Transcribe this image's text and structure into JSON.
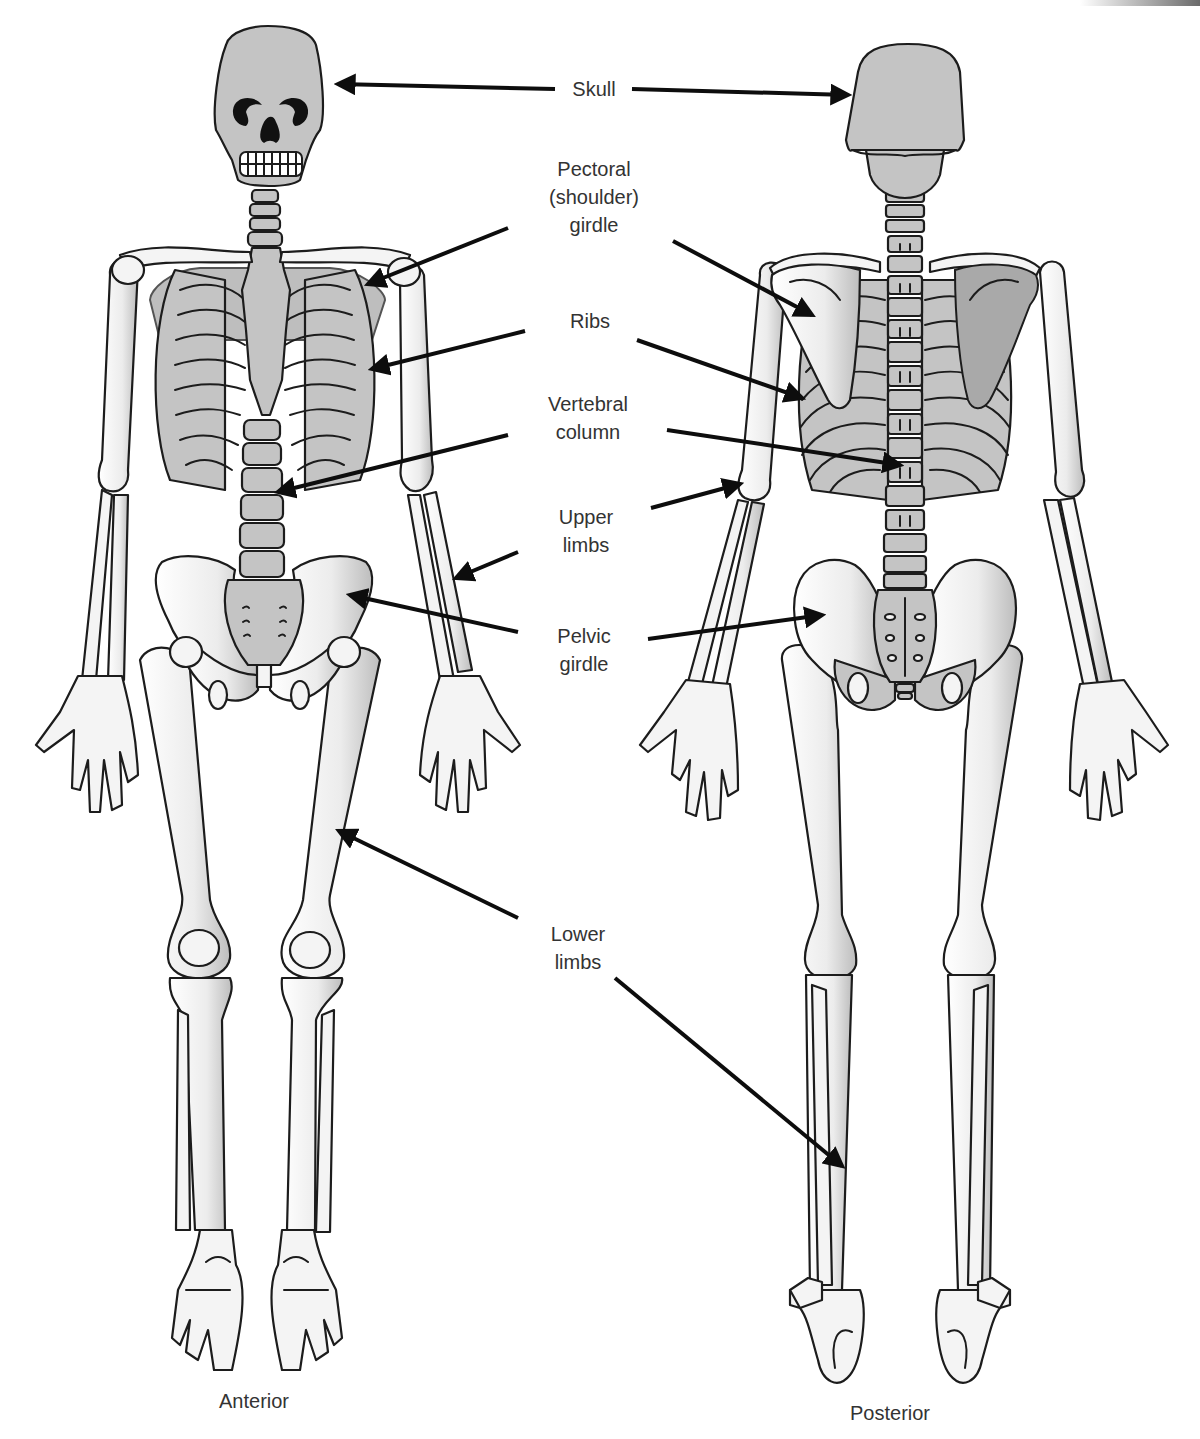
{
  "figure": {
    "views": [
      {
        "id": "anterior",
        "caption": "Anterior",
        "caption_x": 254,
        "caption_y": 1390
      },
      {
        "id": "posterior",
        "caption": "Posterior",
        "caption_x": 890,
        "caption_y": 1402
      }
    ],
    "colors": {
      "bone_light": "#f4f4f4",
      "bone_grey": "#c4c4c4",
      "bone_dark": "#a9a9a9",
      "outline": "#1c1c1c",
      "arrow": "#0d0d0d",
      "label_text": "#333333",
      "background": "#ffffff"
    },
    "labels": [
      {
        "id": "skull",
        "lines": [
          "Skull"
        ],
        "x": 594,
        "y": 75
      },
      {
        "id": "pectoral-girdle",
        "lines": [
          "Pectoral",
          "(shoulder)",
          "girdle"
        ],
        "x": 594,
        "y": 155
      },
      {
        "id": "ribs",
        "lines": [
          "Ribs"
        ],
        "x": 590,
        "y": 307
      },
      {
        "id": "vertebral-column",
        "lines": [
          "Vertebral",
          "column"
        ],
        "x": 588,
        "y": 390
      },
      {
        "id": "upper-limbs",
        "lines": [
          "Upper",
          "limbs"
        ],
        "x": 586,
        "y": 503
      },
      {
        "id": "pelvic-girdle",
        "lines": [
          "Pelvic",
          "girdle"
        ],
        "x": 584,
        "y": 622
      },
      {
        "id": "lower-limbs",
        "lines": [
          "Lower",
          "limbs"
        ],
        "x": 578,
        "y": 920
      }
    ],
    "arrows": [
      {
        "label": "skull",
        "side": "anterior",
        "x1": 555,
        "y1": 89,
        "x2": 338,
        "y2": 84
      },
      {
        "label": "skull",
        "side": "posterior",
        "x1": 632,
        "y1": 89,
        "x2": 848,
        "y2": 95
      },
      {
        "label": "pectoral-girdle",
        "side": "anterior",
        "x1": 508,
        "y1": 228,
        "x2": 368,
        "y2": 284
      },
      {
        "label": "pectoral-girdle",
        "side": "posterior",
        "x1": 673,
        "y1": 241,
        "x2": 812,
        "y2": 315
      },
      {
        "label": "ribs",
        "side": "anterior",
        "x1": 525,
        "y1": 331,
        "x2": 372,
        "y2": 369
      },
      {
        "label": "ribs",
        "side": "posterior",
        "x1": 637,
        "y1": 340,
        "x2": 802,
        "y2": 398
      },
      {
        "label": "vertebral-column",
        "side": "anterior",
        "x1": 508,
        "y1": 435,
        "x2": 278,
        "y2": 492
      },
      {
        "label": "vertebral-column",
        "side": "posterior",
        "x1": 667,
        "y1": 430,
        "x2": 900,
        "y2": 465
      },
      {
        "label": "upper-limbs",
        "side": "anterior",
        "x1": 518,
        "y1": 552,
        "x2": 456,
        "y2": 578
      },
      {
        "label": "upper-limbs",
        "side": "posterior",
        "x1": 651,
        "y1": 508,
        "x2": 740,
        "y2": 484
      },
      {
        "label": "pelvic-girdle",
        "side": "anterior",
        "x1": 518,
        "y1": 632,
        "x2": 350,
        "y2": 595
      },
      {
        "label": "pelvic-girdle",
        "side": "posterior",
        "x1": 648,
        "y1": 639,
        "x2": 822,
        "y2": 615
      },
      {
        "label": "lower-limbs",
        "side": "anterior",
        "x1": 518,
        "y1": 918,
        "x2": 339,
        "y2": 831
      },
      {
        "label": "lower-limbs",
        "side": "posterior",
        "x1": 615,
        "y1": 978,
        "x2": 842,
        "y2": 1166
      }
    ]
  }
}
